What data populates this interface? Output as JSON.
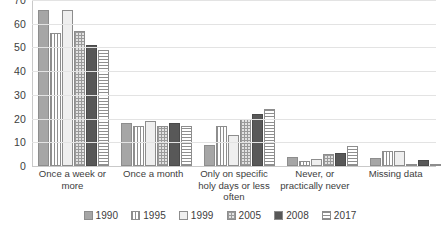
{
  "chart_data": {
    "type": "bar",
    "title": "",
    "subtitle": "",
    "xlabel": "",
    "ylabel": "",
    "ylim": [
      0,
      70
    ],
    "yticks": [
      0,
      10,
      20,
      30,
      40,
      50,
      60,
      70
    ],
    "grid": true,
    "legend_position": "bottom",
    "categories": [
      "Once a week or more",
      "Once a month",
      "Only on specific holy days or less often",
      "Never, or practically never",
      "Missing data"
    ],
    "series": [
      {
        "name": "1990",
        "pattern": "solid-gray",
        "color": "#a6a6a6",
        "values": [
          66,
          18,
          9,
          4,
          3.5
        ]
      },
      {
        "name": "1995",
        "pattern": "vertical-stripes",
        "color": "#ffffff",
        "values": [
          56,
          17,
          17,
          2,
          6.5
        ]
      },
      {
        "name": "1999",
        "pattern": "solid-light",
        "color": "#efefef",
        "values": [
          66,
          19,
          13,
          3,
          6.5
        ]
      },
      {
        "name": "2005",
        "pattern": "checkered",
        "color": "#e2e2e2",
        "values": [
          57,
          17,
          20,
          5,
          0.5
        ]
      },
      {
        "name": "2008",
        "pattern": "solid-dark",
        "color": "#585858",
        "values": [
          51,
          18,
          22,
          5.5,
          2.5
        ]
      },
      {
        "name": "2017",
        "pattern": "horizontal-stripes",
        "color": "#ffffff",
        "values": [
          49,
          17,
          24,
          8.5,
          1
        ]
      }
    ]
  },
  "axis": {
    "tick_labels": [
      "70",
      "60",
      "50",
      "40",
      "30",
      "20",
      "10",
      "0"
    ]
  },
  "category_labels": [
    "Once a week or more",
    "Once a month",
    "Only on specific holy days or less often",
    "Never, or practically never",
    "Missing data"
  ],
  "legend": {
    "items": [
      {
        "label": "1990"
      },
      {
        "label": "1995"
      },
      {
        "label": "1999"
      },
      {
        "label": "2005"
      },
      {
        "label": "2008"
      },
      {
        "label": "2017"
      }
    ]
  }
}
